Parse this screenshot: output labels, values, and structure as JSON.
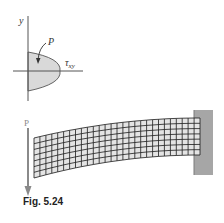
{
  "figure": {
    "caption": "Fig. 5.24",
    "shear_diagram": {
      "axis_y_label": "y",
      "load_label": "P",
      "stress_label_main": "τ",
      "stress_label_sub": "xy",
      "fill_color": "#d9d9d9",
      "line_color": "#555555"
    },
    "beam": {
      "load_label": "P",
      "arrow_color": "#8a8a8a",
      "wall_color": "#a6a6a6",
      "mesh_fill": "#e4e4e4",
      "mesh_line": "#1a1a1a",
      "rows": 7,
      "columns": 28
    }
  }
}
